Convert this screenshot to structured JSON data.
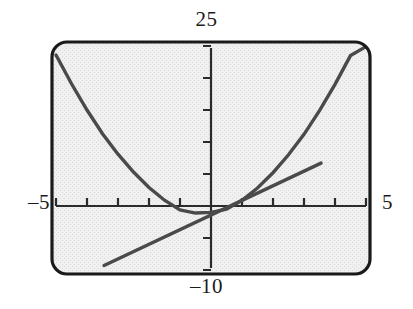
{
  "screen": {
    "kind": "graphing-calculator-screen",
    "frame": {
      "x": 50,
      "y": 40,
      "width": 322,
      "height": 236,
      "corner_radius": 16
    },
    "border_color": "#1a1a1a",
    "background_color": "#ececec",
    "curve_color": "#4a4a4a",
    "axis_color": "#2a2a2a"
  },
  "labels": {
    "ymax": "25",
    "ymin": "–10",
    "xmin": "–5",
    "xmax": "5"
  },
  "chart_data": {
    "type": "line",
    "title": "",
    "xlabel": "",
    "ylabel": "",
    "xlim": [
      -5,
      5
    ],
    "ylim": [
      -10,
      25
    ],
    "grid": false,
    "legend": "none",
    "xtick_step": 1,
    "ytick_step": 5,
    "xticks": [
      -5,
      -4,
      -3,
      -2,
      -1,
      0,
      1,
      2,
      3,
      4,
      5
    ],
    "yticks": [
      -10,
      -5,
      0,
      5,
      10,
      15,
      20,
      25
    ],
    "annotations": {
      "ymax_label": "25",
      "ymin_label": "–10",
      "xmin_label": "–5",
      "xmax_label": "5"
    },
    "series": [
      {
        "name": "parabola",
        "type": "line",
        "shape": "parabola",
        "color": "#4a4a4a",
        "vertex": [
          -0.35,
          -1.2
        ],
        "x": [
          -5.0,
          -4.5,
          -4.0,
          -3.5,
          -3.0,
          -2.5,
          -2.0,
          -1.5,
          -1.0,
          -0.5,
          0.0,
          0.5,
          1.0,
          1.5,
          2.0,
          2.5,
          3.0,
          3.5,
          4.0,
          4.5,
          5.0
        ],
        "y": [
          23.6,
          19.1,
          15.0,
          11.3,
          8.1,
          5.3,
          2.9,
          0.9,
          -0.6,
          -1.1,
          -1.0,
          -0.5,
          0.9,
          2.8,
          5.2,
          8.0,
          11.2,
          14.9,
          19.0,
          23.5,
          24.9
        ]
      },
      {
        "name": "line",
        "type": "line",
        "shape": "straight",
        "color": "#4a4a4a",
        "x": [
          -3.45,
          3.55
        ],
        "y": [
          -9.3,
          6.7
        ]
      }
    ]
  }
}
